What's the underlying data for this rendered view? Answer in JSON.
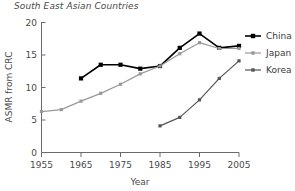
{
  "chart_data": {
    "type": "line",
    "title": "South East Asian Countries",
    "xlabel": "Year",
    "ylabel": "ASMR from CRC",
    "xlim": [
      1955,
      2005
    ],
    "ylim": [
      0,
      20
    ],
    "xticks": [
      1955,
      1965,
      1975,
      1985,
      1995,
      2005
    ],
    "yticks": [
      0,
      5,
      10,
      15,
      20
    ],
    "grid": false,
    "legend_position": "right",
    "series": [
      {
        "name": "China",
        "color": "#000000",
        "marker": "square",
        "x": [
          1965,
          1970,
          1975,
          1980,
          1985,
          1990,
          1995,
          2000,
          2005
        ],
        "values": [
          11.4,
          13.5,
          13.5,
          12.9,
          13.3,
          16.1,
          18.3,
          16.1,
          16.4
        ]
      },
      {
        "name": "Japan",
        "color": "#999999",
        "marker": "square",
        "x": [
          1955,
          1960,
          1965,
          1970,
          1975,
          1980,
          1985,
          1990,
          1995,
          2000,
          2005
        ],
        "values": [
          6.3,
          6.6,
          7.9,
          9.1,
          10.5,
          12.1,
          13.3,
          15.2,
          16.9,
          16.0,
          16.0
        ]
      },
      {
        "name": "Korea",
        "color": "#555555",
        "marker": "square",
        "x": [
          1985,
          1990,
          1995,
          2000,
          2005
        ],
        "values": [
          4.1,
          5.4,
          8.1,
          11.4,
          14.1
        ]
      }
    ]
  },
  "legend": {
    "items": [
      {
        "label": "China"
      },
      {
        "label": "Japan"
      },
      {
        "label": "Korea"
      }
    ]
  },
  "axes": {
    "x_tick_labels": [
      "1955",
      "1965",
      "1975",
      "1985",
      "1995",
      "2005"
    ],
    "y_tick_labels": [
      "0",
      "5",
      "10",
      "15",
      "20"
    ]
  }
}
